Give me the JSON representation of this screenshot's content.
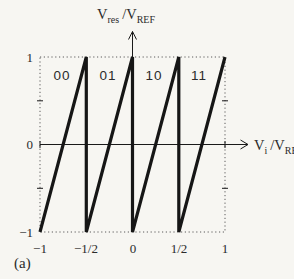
{
  "figure": {
    "caption": "(a)"
  },
  "labels": {
    "y_axis": {
      "v": "V",
      "sub": "res",
      "mid": "/V",
      "sub2": "REF"
    },
    "x_axis": {
      "v": "V",
      "sub": "i",
      "mid": "/V",
      "sub2": "REF"
    }
  },
  "chart_data": {
    "type": "line",
    "title": "",
    "xlabel": "V_i / V_REF",
    "ylabel": "V_res / V_REF",
    "xlim": [
      -1,
      1
    ],
    "ylim": [
      -1,
      1
    ],
    "x_ticks": [
      "−1",
      "−1/2",
      "0",
      "1/2",
      "1"
    ],
    "x_tick_values": [
      -1,
      -0.5,
      0,
      0.5,
      1
    ],
    "y_ticks": [
      "1",
      "0",
      "−1"
    ],
    "y_tick_values": [
      1,
      0,
      -1
    ],
    "minor_tick_values": [
      0.5,
      -0.5
    ],
    "region_labels": [
      "00",
      "01",
      "10",
      "11"
    ],
    "series": [
      {
        "name": "residue-sawtooth",
        "points": [
          [
            -1,
            -1
          ],
          [
            -0.5,
            1
          ],
          [
            -0.5,
            -1
          ],
          [
            0,
            1
          ],
          [
            0,
            -1
          ],
          [
            0.5,
            1
          ],
          [
            0.5,
            -1
          ],
          [
            1,
            1
          ]
        ]
      }
    ],
    "grid": "dotted boundary box, no interior grid",
    "legend": "none",
    "colors": {
      "line": "#161616",
      "axis": "#1a1a1a",
      "text": "#2b2b2b",
      "border_dots": "#4a4a4a",
      "background": "#f7f6f2"
    }
  }
}
